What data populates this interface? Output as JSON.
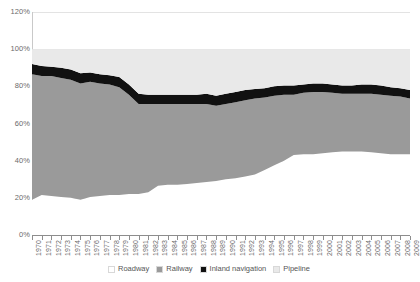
{
  "chart_data": {
    "type": "area",
    "title": "",
    "xlabel": "",
    "ylabel": "",
    "ylim": [
      0,
      120
    ],
    "ytick_labels": [
      "0%",
      "20%",
      "40%",
      "60%",
      "80%",
      "100%",
      "120%"
    ],
    "ytick_values": [
      0,
      20,
      40,
      60,
      80,
      100,
      120
    ],
    "grid": true,
    "legend_position": "bottom",
    "stacked": true,
    "stack_order_bottom_to_top": [
      "Roadway",
      "Railway",
      "Inland navigation",
      "Pipeline"
    ],
    "x": [
      1970,
      1971,
      1972,
      1973,
      1974,
      1975,
      1976,
      1977,
      1978,
      1979,
      1980,
      1981,
      1982,
      1983,
      1984,
      1985,
      1986,
      1987,
      1988,
      1989,
      1990,
      1991,
      1992,
      1993,
      1994,
      1995,
      1996,
      1997,
      1998,
      1999,
      2000,
      2001,
      2002,
      2003,
      2004,
      2005,
      2006,
      2007,
      2008,
      2009
    ],
    "xtick_labels": [
      "1970",
      "1971",
      "1972",
      "1973",
      "1974",
      "1975",
      "1976",
      "1977",
      "1978",
      "1979",
      "1980",
      "1981",
      "1982",
      "1983",
      "1984",
      "1985",
      "1986",
      "1987",
      "1988",
      "1989",
      "1990",
      "1991",
      "1992",
      "1993",
      "1994",
      "1995",
      "1996",
      "1997",
      "1998",
      "1999",
      "2000",
      "2001",
      "2002",
      "2003",
      "2004",
      "2005",
      "2006",
      "2007",
      "2008",
      "2009"
    ],
    "series": [
      {
        "name": "Roadway",
        "color": "#ffffff",
        "values": [
          19.0,
          21.5,
          21.0,
          20.5,
          20.0,
          19.0,
          20.5,
          21.0,
          21.5,
          21.5,
          22.0,
          22.0,
          23.0,
          26.5,
          27.0,
          27.0,
          27.5,
          28.0,
          28.5,
          29.0,
          30.0,
          30.5,
          31.5,
          32.5,
          35.0,
          37.5,
          40.0,
          43.0,
          43.5,
          43.5,
          44.0,
          44.5,
          45.0,
          45.0,
          45.0,
          44.5,
          44.0,
          43.5,
          43.5,
          43.5
        ]
      },
      {
        "name": "Railway",
        "color": "#9a9a9a",
        "values": [
          67.5,
          64.0,
          64.5,
          64.0,
          63.5,
          62.5,
          62.0,
          60.5,
          59.5,
          58.0,
          53.5,
          48.5,
          47.5,
          44.0,
          43.5,
          43.5,
          43.0,
          42.5,
          42.0,
          40.5,
          40.5,
          41.0,
          41.0,
          41.0,
          39.0,
          37.5,
          35.5,
          32.5,
          33.0,
          33.5,
          33.0,
          32.0,
          31.0,
          31.0,
          31.0,
          31.5,
          31.5,
          31.5,
          31.0,
          30.0
        ]
      },
      {
        "name": "Inland navigation",
        "color": "#111111",
        "values": [
          5.5,
          5.5,
          5.0,
          5.5,
          5.5,
          5.5,
          5.0,
          5.0,
          5.0,
          5.5,
          5.5,
          5.5,
          5.0,
          5.0,
          5.0,
          5.0,
          5.0,
          5.0,
          5.5,
          5.5,
          5.5,
          5.5,
          5.5,
          5.0,
          5.0,
          5.0,
          5.0,
          5.0,
          4.5,
          4.5,
          4.5,
          4.5,
          4.5,
          4.5,
          5.0,
          5.0,
          5.0,
          4.5,
          4.5,
          4.5
        ]
      },
      {
        "name": "Pipeline",
        "color": "#e9e9e9",
        "values": [
          8.0,
          9.0,
          9.5,
          10.0,
          11.0,
          13.0,
          12.5,
          13.5,
          14.0,
          15.0,
          19.0,
          24.0,
          24.5,
          24.5,
          24.5,
          24.5,
          24.5,
          24.5,
          24.0,
          25.0,
          24.0,
          23.0,
          22.0,
          21.5,
          21.0,
          20.0,
          19.5,
          19.5,
          19.0,
          18.5,
          18.5,
          19.0,
          19.5,
          19.5,
          19.0,
          19.0,
          19.5,
          20.5,
          21.0,
          22.0
        ]
      }
    ],
    "legend": [
      {
        "label": "Roadway",
        "color": "#ffffff"
      },
      {
        "label": "Railway",
        "color": "#9a9a9a"
      },
      {
        "label": "Inland navigation",
        "color": "#111111"
      },
      {
        "label": "Pipeline",
        "color": "#e9e9e9"
      }
    ]
  }
}
